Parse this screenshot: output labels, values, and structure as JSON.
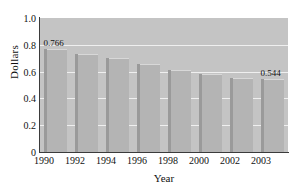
{
  "chart_data": {
    "type": "bar",
    "title": "",
    "xlabel": "Year",
    "ylabel": "Dollars",
    "categories": [
      "1990",
      "1992",
      "1994",
      "1996",
      "1998",
      "2000",
      "2002",
      "2003"
    ],
    "values": [
      0.766,
      0.731,
      0.7,
      0.657,
      0.612,
      0.582,
      0.553,
      0.544
    ],
    "ylim": [
      0,
      1.0
    ],
    "yticks": [
      "0",
      "0.2",
      "0.4",
      "0.6",
      "0.8",
      "1.0"
    ],
    "ytick_values": [
      0,
      0.2,
      0.4,
      0.6,
      0.8,
      1.0
    ],
    "grid": true,
    "grid_axis": "y",
    "legend": "none",
    "annotations": [
      {
        "category": "1990",
        "value": 0.766,
        "label": "0.766"
      },
      {
        "category": "2003",
        "value": 0.544,
        "label": "0.544"
      }
    ],
    "colors": {
      "plot_background": "#c4c4c4",
      "bar_fill": "#b4b4b4",
      "bar_edge": "#9a9a9a",
      "gridline": "#efefef",
      "axis": "#3b3b3b",
      "text": "#111111",
      "page_background": "#ffffff"
    }
  }
}
